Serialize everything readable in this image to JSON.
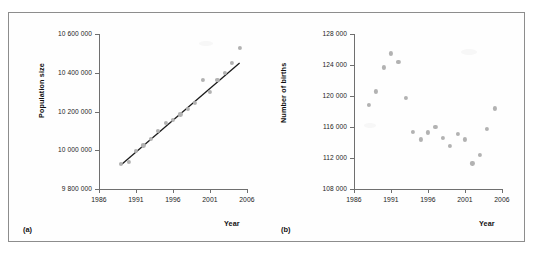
{
  "figure": {
    "panels": [
      {
        "key": "(a)",
        "ylabel": "Population size",
        "xlabel": "Year"
      },
      {
        "key": "(b)",
        "ylabel": "Number of births",
        "xlabel": "Year"
      }
    ]
  },
  "chart_data": [
    {
      "type": "scatter",
      "panel": "(a)",
      "title": "",
      "xlabel": "Year",
      "ylabel": "Population size",
      "xlim": [
        1986,
        2006
      ],
      "ylim": [
        9800000,
        10600000
      ],
      "xticks": [
        1986,
        1991,
        1996,
        2001,
        2006
      ],
      "yticks": [
        9800000,
        10000000,
        10200000,
        10400000,
        10600000
      ],
      "ytick_labels": [
        "9 800 000",
        "10 000 000",
        "10 200 000",
        "10 400 000",
        "10 600 000"
      ],
      "xtick_labels": [
        "1986",
        "1991",
        "1996",
        "2001",
        "2006"
      ],
      "grid": false,
      "legend": false,
      "x": [
        1989,
        1990,
        1991,
        1992,
        1993,
        1994,
        1995,
        1996,
        1997,
        1998,
        1999,
        2000,
        2001,
        2002,
        2003,
        2004,
        2005
      ],
      "y": [
        9930000,
        9940000,
        9995000,
        10025000,
        10060000,
        10100000,
        10140000,
        10155000,
        10185000,
        10215000,
        10245000,
        10365000,
        10300000,
        10365000,
        10400000,
        10450000,
        10530000
      ],
      "trendline": {
        "type": "linear",
        "x_start": 1989,
        "y_start": 9925000,
        "x_end": 2005,
        "y_end": 10450000
      }
    },
    {
      "type": "scatter",
      "panel": "(b)",
      "title": "",
      "xlabel": "Year",
      "ylabel": "Number of births",
      "xlim": [
        1986,
        2006
      ],
      "ylim": [
        108000,
        128000
      ],
      "xticks": [
        1986,
        1991,
        1996,
        2001,
        2006
      ],
      "yticks": [
        108000,
        112000,
        116000,
        120000,
        124000,
        128000
      ],
      "ytick_labels": [
        "108 000",
        "112 000",
        "116 000",
        "120 000",
        "124 000",
        "128 000"
      ],
      "xtick_labels": [
        "1986",
        "1991",
        "1996",
        "2001",
        "2006"
      ],
      "grid": false,
      "legend": false,
      "x": [
        1988,
        1989,
        1990,
        1991,
        1992,
        1993,
        1994,
        1995,
        1996,
        1997,
        1998,
        1999,
        2000,
        2001,
        2002,
        2003,
        2004,
        2005
      ],
      "y": [
        118800,
        120600,
        123700,
        125500,
        124400,
        119800,
        115400,
        114400,
        115300,
        116000,
        114600,
        113600,
        115100,
        114400,
        111300,
        112400,
        115800,
        118400
      ]
    }
  ],
  "style": {
    "dot_color": "#b2b2b2",
    "trendline_color": "#1a1a1a",
    "axis_color": "#6f6f6f",
    "text_color": "#1c1c1c",
    "border_color": "#8d8d8d"
  }
}
